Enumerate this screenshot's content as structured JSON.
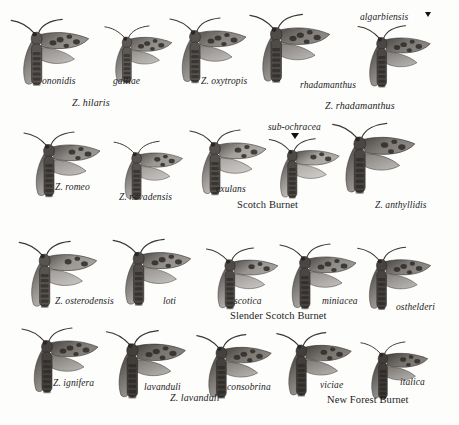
{
  "plate": {
    "background_color": "#fdfdfc",
    "ink_color": "#1c1c1c",
    "rows": [
      {
        "row_id": "row-1",
        "group_labels": [
          {
            "text": "Z. hilaris",
            "x": 72,
            "y": 97
          },
          {
            "text": "Z. rhadamanthus",
            "x": 325,
            "y": 100
          }
        ],
        "specimen_labels": [
          {
            "text": "ononidis",
            "x": 42,
            "y": 76
          },
          {
            "text": "galliae",
            "x": 113,
            "y": 76
          },
          {
            "text": "Z. oxytropis",
            "x": 201,
            "y": 76
          },
          {
            "text": "rhadamanthus",
            "x": 300,
            "y": 80
          },
          {
            "text": "algarbiensis",
            "x": 360,
            "y": 12
          }
        ],
        "markers": [
          {
            "name": "algarbiensis-marker",
            "x": 425,
            "y": 12
          }
        ]
      },
      {
        "row_id": "row-2",
        "group_labels": [],
        "specimen_labels": [
          {
            "text": "Z. romeo",
            "x": 55,
            "y": 182
          },
          {
            "text": "Z. nevadensis",
            "x": 119,
            "y": 192
          },
          {
            "text": "exulans",
            "x": 216,
            "y": 184
          },
          {
            "text": "sub-ochracea",
            "x": 268,
            "y": 122
          },
          {
            "text": "Z. anthyllidis",
            "x": 375,
            "y": 200
          }
        ],
        "common_labels": [
          {
            "text": "Scotch Burnet",
            "x": 237,
            "y": 199
          }
        ],
        "markers": [
          {
            "name": "sub-ochracea-marker",
            "x": 291,
            "y": 133
          }
        ]
      },
      {
        "row_id": "row-3",
        "group_labels": [],
        "specimen_labels": [
          {
            "text": "Z. osterodensis",
            "x": 55,
            "y": 296
          },
          {
            "text": "loti",
            "x": 163,
            "y": 296
          },
          {
            "text": "scotica",
            "x": 234,
            "y": 296
          },
          {
            "text": "miniacea",
            "x": 322,
            "y": 296
          },
          {
            "text": "osthelderi",
            "x": 396,
            "y": 302
          }
        ],
        "common_labels": [
          {
            "text": "Slender Scotch Burnet",
            "x": 230,
            "y": 310
          }
        ],
        "markers": []
      },
      {
        "row_id": "row-4",
        "group_labels": [
          {
            "text": "Z. lavanduli",
            "x": 170,
            "y": 392
          }
        ],
        "specimen_labels": [
          {
            "text": "Z. ignifera",
            "x": 53,
            "y": 378
          },
          {
            "text": "lavanduli",
            "x": 144,
            "y": 382
          },
          {
            "text": "consobrina",
            "x": 227,
            "y": 382
          },
          {
            "text": "viciae",
            "x": 320,
            "y": 380
          },
          {
            "text": "italica",
            "x": 400,
            "y": 377
          }
        ],
        "common_labels": [
          {
            "text": "New Forest Burnet",
            "x": 327,
            "y": 394
          }
        ],
        "markers": []
      }
    ],
    "specimens": [
      {
        "name": "ononidis",
        "x": 8,
        "y": 18,
        "scale": 1.02,
        "body_tone": "#595552",
        "wing_tone": "#8a8682",
        "spots": 5
      },
      {
        "name": "galliae",
        "x": 96,
        "y": 20,
        "scale": 0.88,
        "body_tone": "#5c5854",
        "wing_tone": "#8d8985",
        "spots": 5
      },
      {
        "name": "oxytropis",
        "x": 166,
        "y": 16,
        "scale": 1.0,
        "body_tone": "#56524f",
        "wing_tone": "#86827e",
        "spots": 5
      },
      {
        "name": "rhadamanthus",
        "x": 248,
        "y": 14,
        "scale": 1.05,
        "body_tone": "#4f4b48",
        "wing_tone": "#7e7a76",
        "spots": 5
      },
      {
        "name": "algarbiensis",
        "x": 352,
        "y": 22,
        "scale": 0.95,
        "body_tone": "#4a4643",
        "wing_tone": "#7b7773",
        "spots": 5
      },
      {
        "name": "romeo",
        "x": 20,
        "y": 130,
        "scale": 1.0,
        "body_tone": "#4e4a47",
        "wing_tone": "#8e8a86",
        "spots": 4
      },
      {
        "name": "nevadensis",
        "x": 106,
        "y": 136,
        "scale": 0.9,
        "body_tone": "#56524f",
        "wing_tone": "#9b9793",
        "spots": 4
      },
      {
        "name": "exulans",
        "x": 186,
        "y": 128,
        "scale": 1.0,
        "body_tone": "#54504d",
        "wing_tone": "#a5a19d",
        "spots": 4
      },
      {
        "name": "sub-ochracea",
        "x": 262,
        "y": 134,
        "scale": 0.92,
        "body_tone": "#4d4946",
        "wing_tone": "#a8a4a0",
        "spots": 3
      },
      {
        "name": "anthyllidis",
        "x": 332,
        "y": 124,
        "scale": 1.08,
        "body_tone": "#4a4643",
        "wing_tone": "#7e7a76",
        "spots": 4
      },
      {
        "name": "osterodensis",
        "x": 16,
        "y": 240,
        "scale": 1.02,
        "body_tone": "#57534f",
        "wing_tone": "#9a9692",
        "spots": 3
      },
      {
        "name": "loti",
        "x": 110,
        "y": 238,
        "scale": 1.02,
        "body_tone": "#4f4b48",
        "wing_tone": "#908c88",
        "spots": 5
      },
      {
        "name": "scotica",
        "x": 200,
        "y": 244,
        "scale": 0.94,
        "body_tone": "#4d4946",
        "wing_tone": "#999591",
        "spots": 3
      },
      {
        "name": "miniacea",
        "x": 276,
        "y": 242,
        "scale": 1.0,
        "body_tone": "#4a4643",
        "wing_tone": "#8d8985",
        "spots": 5
      },
      {
        "name": "osthelderi",
        "x": 352,
        "y": 244,
        "scale": 0.96,
        "body_tone": "#474340",
        "wing_tone": "#807c78",
        "spots": 5
      },
      {
        "name": "ignifera",
        "x": 18,
        "y": 326,
        "scale": 1.0,
        "body_tone": "#45413e",
        "wing_tone": "#79756f",
        "spots": 5
      },
      {
        "name": "lavanduli",
        "x": 104,
        "y": 330,
        "scale": 1.04,
        "body_tone": "#423e3b",
        "wing_tone": "#76726c",
        "spots": 5
      },
      {
        "name": "consobrina",
        "x": 192,
        "y": 332,
        "scale": 0.98,
        "body_tone": "#44403d",
        "wing_tone": "#7a766f",
        "spots": 5
      },
      {
        "name": "viciae",
        "x": 272,
        "y": 330,
        "scale": 0.98,
        "body_tone": "#413d3a",
        "wing_tone": "#75716b",
        "spots": 4
      },
      {
        "name": "italica",
        "x": 352,
        "y": 336,
        "scale": 0.88,
        "body_tone": "#403c39",
        "wing_tone": "#736f69",
        "spots": 4
      }
    ]
  }
}
